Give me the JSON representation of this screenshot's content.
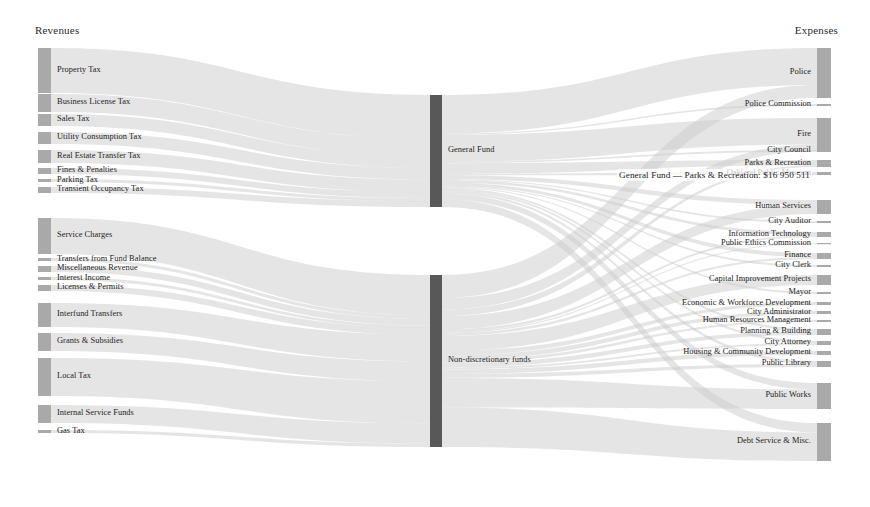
{
  "chart_data": {
    "type": "sankey",
    "title": "",
    "columns": {
      "left_title": "Revenues",
      "right_title": "Expenses"
    },
    "colors": {
      "node_fill": "#a9a9a9",
      "node_fill_dark": "#585858",
      "link_fill": "#cccccc",
      "text": "#232323",
      "background": "#ffffff"
    },
    "tooltip": {
      "visible": true,
      "text": "General Fund — Parks & Recreation: $16 950 511",
      "source": "General Fund",
      "target": "Parks & Recreation",
      "value": 16950511
    },
    "nodes": {
      "sources": [
        {
          "name": "Property Tax",
          "value": 201,
          "y": 48,
          "h": 45
        },
        {
          "name": "Business License Tax",
          "value": 80,
          "y": 94,
          "h": 18
        },
        {
          "name": "Sales Tax",
          "value": 54,
          "y": 114,
          "h": 12
        },
        {
          "name": "Utility Consumption Tax",
          "value": 54,
          "y": 132,
          "h": 12
        },
        {
          "name": "Real Estate Transfer Tax",
          "value": 58,
          "y": 150,
          "h": 13
        },
        {
          "name": "Fines & Penalties",
          "value": 27,
          "y": 168,
          "h": 6
        },
        {
          "name": "Parking Tax",
          "value": 14,
          "y": 179,
          "h": 3
        },
        {
          "name": "Transient Occupancy Tax",
          "value": 27,
          "y": 187,
          "h": 6
        },
        {
          "name": "Service Charges",
          "value": 162,
          "y": 218,
          "h": 36
        },
        {
          "name": "Transfers from Fund Balance",
          "value": 14,
          "y": 258,
          "h": 3
        },
        {
          "name": "Miscellaneous Revenue",
          "value": 27,
          "y": 266,
          "h": 6
        },
        {
          "name": "Interest Income",
          "value": 10,
          "y": 277,
          "h": 3
        },
        {
          "name": "Licenses & Permits",
          "value": 27,
          "y": 285,
          "h": 6
        },
        {
          "name": "Interfund Transfers",
          "value": 107,
          "y": 303,
          "h": 24
        },
        {
          "name": "Grants & Subsidies",
          "value": 80,
          "y": 333,
          "h": 18
        },
        {
          "name": "Local Tax",
          "value": 170,
          "y": 358,
          "h": 38
        },
        {
          "name": "Internal Service Funds",
          "value": 80,
          "y": 405,
          "h": 18
        },
        {
          "name": "Gas Tax",
          "value": 14,
          "y": 430,
          "h": 3
        }
      ],
      "middle": [
        {
          "name": "General Fund",
          "value": 560,
          "y": 95,
          "h": 112
        },
        {
          "name": "Non-discretionary funds",
          "value": 800,
          "y": 275,
          "h": 172
        }
      ],
      "targets": [
        {
          "name": "Police",
          "value": 270,
          "y": 48,
          "h": 50
        },
        {
          "name": "Police Commission",
          "value": 9,
          "y": 104,
          "h": 2
        },
        {
          "name": "Fire",
          "value": 175,
          "y": 118,
          "h": 33
        },
        {
          "name": "City Council",
          "value": 9,
          "y": 150,
          "h": 2
        },
        {
          "name": "Parks & Recreation",
          "value": 75,
          "y": 160,
          "h": 7
        },
        {
          "name": "Oakland Public Museum",
          "value": 9,
          "y": 172,
          "h": 3
        },
        {
          "name": "Human Services",
          "value": 60,
          "y": 200,
          "h": 14
        },
        {
          "name": "City Auditor",
          "value": 5,
          "y": 221,
          "h": 2
        },
        {
          "name": "Information Technology",
          "value": 22,
          "y": 232,
          "h": 5
        },
        {
          "name": "Public Ethics Commission",
          "value": 4,
          "y": 243,
          "h": 1
        },
        {
          "name": "Finance",
          "value": 24,
          "y": 253,
          "h": 6
        },
        {
          "name": "City Clerk",
          "value": 6,
          "y": 265,
          "h": 2
        },
        {
          "name": "Capital Improvement Projects",
          "value": 45,
          "y": 275,
          "h": 10
        },
        {
          "name": "Mayor",
          "value": 5,
          "y": 292,
          "h": 2
        },
        {
          "name": "Economic & Workforce Development",
          "value": 14,
          "y": 302,
          "h": 3
        },
        {
          "name": "City Administrator",
          "value": 14,
          "y": 311,
          "h": 3
        },
        {
          "name": "Human Resources Management",
          "value": 9,
          "y": 320,
          "h": 2
        },
        {
          "name": "Planning & Building",
          "value": 24,
          "y": 329,
          "h": 6
        },
        {
          "name": "City Attorney",
          "value": 14,
          "y": 341,
          "h": 4
        },
        {
          "name": "Housing & Community Development",
          "value": 14,
          "y": 351,
          "h": 4
        },
        {
          "name": "Public Library",
          "value": 24,
          "y": 361,
          "h": 6
        },
        {
          "name": "Public Works",
          "value": 120,
          "y": 383,
          "h": 26
        },
        {
          "name": "Debt Service & Misc.",
          "value": 160,
          "y": 423,
          "h": 38
        }
      ]
    },
    "links": [
      {
        "source": "Property Tax",
        "target": "General Fund",
        "value": 201
      },
      {
        "source": "Business License Tax",
        "target": "General Fund",
        "value": 80
      },
      {
        "source": "Sales Tax",
        "target": "General Fund",
        "value": 54
      },
      {
        "source": "Utility Consumption Tax",
        "target": "General Fund",
        "value": 54
      },
      {
        "source": "Real Estate Transfer Tax",
        "target": "General Fund",
        "value": 58
      },
      {
        "source": "Fines & Penalties",
        "target": "General Fund",
        "value": 27
      },
      {
        "source": "Parking Tax",
        "target": "General Fund",
        "value": 14
      },
      {
        "source": "Transient Occupancy Tax",
        "target": "General Fund",
        "value": 27
      },
      {
        "source": "Service Charges",
        "target": "Non-discretionary funds",
        "value": 162
      },
      {
        "source": "Transfers from Fund Balance",
        "target": "Non-discretionary funds",
        "value": 14
      },
      {
        "source": "Miscellaneous Revenue",
        "target": "Non-discretionary funds",
        "value": 27
      },
      {
        "source": "Interest Income",
        "target": "Non-discretionary funds",
        "value": 10
      },
      {
        "source": "Licenses & Permits",
        "target": "Non-discretionary funds",
        "value": 27
      },
      {
        "source": "Interfund Transfers",
        "target": "Non-discretionary funds",
        "value": 107
      },
      {
        "source": "Grants & Subsidies",
        "target": "Non-discretionary funds",
        "value": 80
      },
      {
        "source": "Local Tax",
        "target": "Non-discretionary funds",
        "value": 170
      },
      {
        "source": "Internal Service Funds",
        "target": "Non-discretionary funds",
        "value": 80
      },
      {
        "source": "Gas Tax",
        "target": "Non-discretionary funds",
        "value": 14
      },
      {
        "source": "General Fund",
        "target": "Police",
        "value": 200
      },
      {
        "source": "General Fund",
        "target": "Police Commission",
        "value": 7
      },
      {
        "source": "General Fund",
        "target": "Fire",
        "value": 140
      },
      {
        "source": "General Fund",
        "target": "City Council",
        "value": 8
      },
      {
        "source": "General Fund",
        "target": "Parks & Recreation",
        "value": 55
      },
      {
        "source": "General Fund",
        "target": "Oakland Public Museum",
        "value": 8
      },
      {
        "source": "General Fund",
        "target": "Human Services",
        "value": 20
      },
      {
        "source": "General Fund",
        "target": "City Auditor",
        "value": 5
      },
      {
        "source": "General Fund",
        "target": "Information Technology",
        "value": 14
      },
      {
        "source": "General Fund",
        "target": "Finance",
        "value": 16
      },
      {
        "source": "General Fund",
        "target": "City Clerk",
        "value": 5
      },
      {
        "source": "General Fund",
        "target": "Mayor",
        "value": 5
      },
      {
        "source": "General Fund",
        "target": "Planning & Building",
        "value": 10
      },
      {
        "source": "General Fund",
        "target": "City Attorney",
        "value": 8
      },
      {
        "source": "General Fund",
        "target": "Public Library",
        "value": 12
      },
      {
        "source": "General Fund",
        "target": "Public Works",
        "value": 30
      },
      {
        "source": "General Fund",
        "target": "Debt Service & Misc.",
        "value": 40
      },
      {
        "source": "Non-discretionary funds",
        "target": "Police",
        "value": 70
      },
      {
        "source": "Non-discretionary funds",
        "target": "Fire",
        "value": 35
      },
      {
        "source": "Non-discretionary funds",
        "target": "Parks & Recreation",
        "value": 20
      },
      {
        "source": "Non-discretionary funds",
        "target": "Human Services",
        "value": 40
      },
      {
        "source": "Non-discretionary funds",
        "target": "Information Technology",
        "value": 8
      },
      {
        "source": "Non-discretionary funds",
        "target": "Public Ethics Commission",
        "value": 4
      },
      {
        "source": "Non-discretionary funds",
        "target": "Finance",
        "value": 8
      },
      {
        "source": "Non-discretionary funds",
        "target": "Capital Improvement Projects",
        "value": 45
      },
      {
        "source": "Non-discretionary funds",
        "target": "Economic & Workforce Development",
        "value": 14
      },
      {
        "source": "Non-discretionary funds",
        "target": "City Administrator",
        "value": 14
      },
      {
        "source": "Non-discretionary funds",
        "target": "Human Resources Management",
        "value": 9
      },
      {
        "source": "Non-discretionary funds",
        "target": "Planning & Building",
        "value": 14
      },
      {
        "source": "Non-discretionary funds",
        "target": "City Attorney",
        "value": 6
      },
      {
        "source": "Non-discretionary funds",
        "target": "Housing & Community Development",
        "value": 14
      },
      {
        "source": "Non-discretionary funds",
        "target": "Public Library",
        "value": 12
      },
      {
        "source": "Non-discretionary funds",
        "target": "Public Works",
        "value": 90
      },
      {
        "source": "Non-discretionary funds",
        "target": "Debt Service & Misc.",
        "value": 120
      }
    ],
    "geometry": {
      "left_node_x": 38,
      "left_node_w": 13,
      "mid_node_x": 430,
      "mid_node_w": 12,
      "right_node_x": 817,
      "right_node_w": 14,
      "label_gap": 6
    }
  }
}
